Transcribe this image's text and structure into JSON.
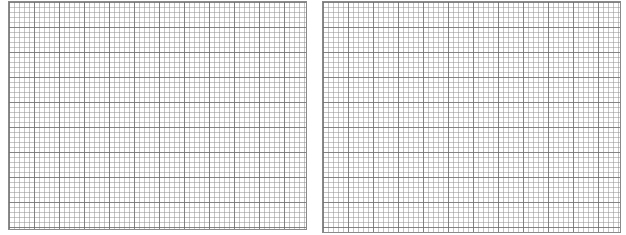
{
  "panels": [
    {
      "id": "left",
      "type": "graph-paper-grid",
      "minor_spacing_px": 5,
      "major_every_n_cells": 5,
      "line_color": "#969696",
      "major_line_color": "#6e6e6e",
      "background": "#ffffff"
    },
    {
      "id": "right",
      "type": "graph-paper-grid",
      "minor_spacing_px": 5,
      "major_every_n_cells": 5,
      "line_color": "#969696",
      "major_line_color": "#6e6e6e",
      "background": "#ffffff"
    }
  ]
}
